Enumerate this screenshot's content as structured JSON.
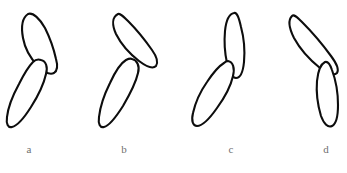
{
  "figure": {
    "background_color": "#ffffff",
    "stroke_color": "#0d0d0d",
    "label_color": "#6f6f6f",
    "caption_text": "",
    "specimens": [
      {
        "label": "a",
        "name": "specimen-a",
        "label_x": 17,
        "panel_x": 0,
        "upper_lobe_path": "M 28 14 C 22 18 21 27 23 38 C 25 49 31 59 38 66 C 44 72 50 75 54 73 C 57 71 58 66 56 59 C 54 50 50 38 45 28 C 40 19 33 12 28 14 Z",
        "lower_lobe_path": "M 33 62 C 29 66 24 74 19 84 C 13 95 8 108 7 117 C 6 124 8 128 12 127 C 17 126 24 118 31 107 C 38 96 44 83 46 74 C 48 67 46 61 41 60 C 38 59 35 60 33 62 Z"
      },
      {
        "label": "b",
        "name": "specimen-b",
        "label_x": 112,
        "panel_x": 90,
        "upper_lobe_path": "M 28 14 C 22 17 22 25 26 34 C 31 44 40 54 49 61 C 57 67 63 69 66 66 C 68 63 67 57 62 50 C 55 40 45 28 38 21 C 33 16 30 13 28 14 Z",
        "lower_lobe_path": "M 36 60 C 31 63 25 72 20 83 C 14 95 10 108 9 117 C 8 124 10 128 14 127 C 19 126 26 117 33 106 C 40 94 46 82 48 73 C 50 66 47 60 42 59 C 40 58 38 59 36 60 Z"
      },
      {
        "label": "c",
        "name": "specimen-c",
        "label_x": 219,
        "panel_x": 185,
        "upper_lobe_path": "M 49 13 C 44 14 41 21 40 31 C 39 42 40 54 42 63 C 44 72 47 78 51 78 C 55 78 58 72 59 62 C 60 51 59 38 56 27 C 54 18 52 12 49 13 Z",
        "lower_lobe_path": "M 39 63 C 34 66 28 73 22 82 C 15 92 10 104 8 113 C 6 121 8 126 12 126 C 17 126 25 118 32 108 C 40 97 46 85 48 76 C 50 68 48 62 43 61 C 41 61 40 62 39 63 Z"
      },
      {
        "label": "d",
        "name": "specimen-d",
        "label_x": 314,
        "panel_x": 275,
        "upper_lobe_path": "M 17 16 C 13 20 14 28 19 38 C 25 49 35 60 45 68 C 53 74 59 76 62 73 C 64 70 62 64 56 56 C 48 45 35 30 27 22 C 22 17 19 14 17 16 Z",
        "lower_lobe_path": "M 50 62 C 46 64 43 71 42 81 C 41 93 43 106 46 116 C 49 124 53 128 57 126 C 61 124 63 116 63 105 C 63 92 60 78 57 70 C 55 64 53 61 50 62 Z"
      }
    ]
  }
}
